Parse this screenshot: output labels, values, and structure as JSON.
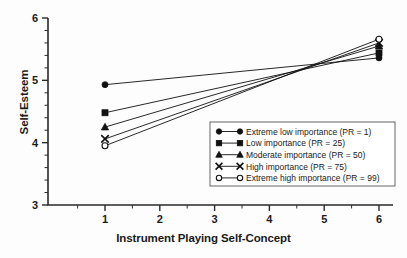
{
  "chart_data": {
    "type": "line",
    "title": "",
    "xlabel": "Instrument Playing Self-Concept",
    "ylabel": "Self-Esteem",
    "xlim": [
      0.45,
      6.35
    ],
    "ylim": [
      3,
      6
    ],
    "xticks": [
      1,
      2,
      3,
      4,
      5,
      6
    ],
    "xtick_labels": [
      "1",
      "2",
      "3",
      "4",
      "5",
      "6"
    ],
    "yticks": [
      3,
      4,
      5,
      6
    ],
    "ytick_labels": [
      "3",
      "4",
      "5",
      "6"
    ],
    "x_minor_ticks": [
      0.5,
      1.5,
      2.5,
      3.5,
      4.5,
      5.5
    ],
    "y_minor_ticks": [
      3.2,
      3.4,
      3.6,
      3.8,
      4.2,
      4.4,
      4.6,
      4.8,
      5.2,
      5.4,
      5.6,
      5.8
    ],
    "grid": false,
    "legend_position": "center-right",
    "x": [
      1,
      6
    ],
    "series": [
      {
        "name": "Extreme low importance (PR = 1)",
        "marker": "filled-circle",
        "values": [
          4.93,
          5.36
        ]
      },
      {
        "name": "Low importance (PR = 25)",
        "marker": "filled-square",
        "values": [
          4.48,
          5.44
        ]
      },
      {
        "name": "Moderate importance (PR = 50)",
        "marker": "filled-triangle",
        "values": [
          4.25,
          5.55
        ]
      },
      {
        "name": "High importance (PR = 75)",
        "marker": "x-cross",
        "values": [
          4.06,
          5.6
        ]
      },
      {
        "name": "Extreme high importance (PR = 99)",
        "marker": "open-circle",
        "values": [
          3.95,
          5.66
        ]
      }
    ],
    "colors": {
      "line": "#111111",
      "axis": "#2a2a2a",
      "text": "#1a1a1a",
      "background": "#fdfdfd",
      "legend_border": "#555555"
    }
  }
}
